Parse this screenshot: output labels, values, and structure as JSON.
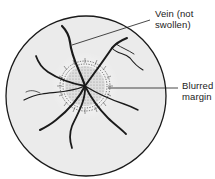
{
  "diagram": {
    "labels": {
      "vein": [
        "Vein (not",
        "swollen)"
      ],
      "margin": [
        "Blurred",
        "margin"
      ]
    },
    "colors": {
      "fundus_fill": "#ebebeb",
      "outline": "#1a1a1a",
      "vessel": "#1a1a1a",
      "disc_fill": "#d6d6d6"
    }
  }
}
